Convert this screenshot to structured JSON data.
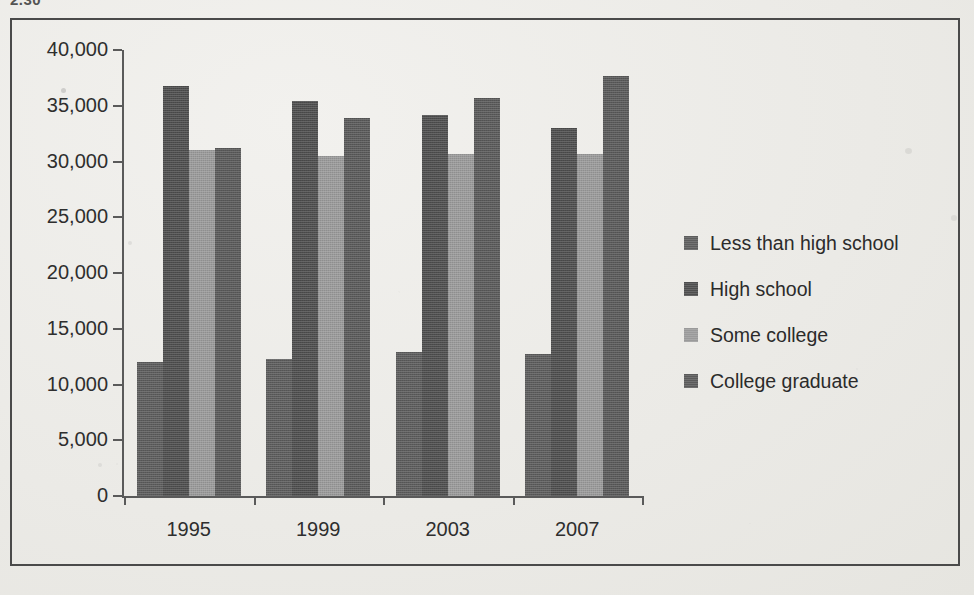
{
  "page": {
    "clipped_caption": "2.30",
    "background_color": "#eceae6",
    "frame_color": "#4a4a4a"
  },
  "chart_data": {
    "type": "bar",
    "title": "",
    "subtitle": "",
    "xlabel": "",
    "ylabel": "",
    "categories": [
      "1995",
      "1999",
      "2003",
      "2007"
    ],
    "series": [
      {
        "name": "Less than high school",
        "color": "#5d5d5d",
        "values": [
          12000,
          12300,
          12900,
          12700
        ]
      },
      {
        "name": "High school",
        "color": "#4e4e4e",
        "values": [
          36800,
          35400,
          34200,
          33000
        ]
      },
      {
        "name": "Some college",
        "color": "#9a9a9a",
        "values": [
          31000,
          30500,
          30700,
          30700
        ]
      },
      {
        "name": "College graduate",
        "color": "#5a5a5a",
        "values": [
          31200,
          33900,
          35700,
          37700
        ]
      }
    ],
    "ylim": [
      0,
      40000
    ],
    "ytick_values": [
      0,
      5000,
      10000,
      15000,
      20000,
      25000,
      30000,
      35000,
      40000
    ],
    "ytick_labels": [
      "0",
      "5,000",
      "10,000",
      "15,000",
      "20,000",
      "25,000",
      "30,000",
      "35,000",
      "40,000"
    ],
    "grid": false,
    "legend_position": "right",
    "legend_entries": [
      "Less than high school",
      "High school",
      "Some college",
      "College graduate"
    ]
  }
}
